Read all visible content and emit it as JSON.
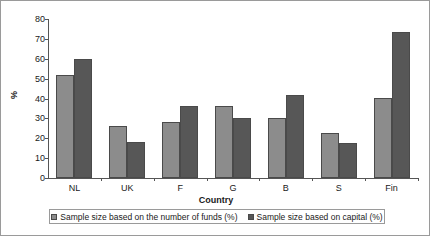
{
  "chart_data": {
    "type": "bar",
    "title": "",
    "subtitle": "",
    "xlabel": "Country",
    "ylabel": "%",
    "ylim": [
      0,
      80
    ],
    "yticks": [
      0,
      10,
      20,
      30,
      40,
      50,
      60,
      70,
      80
    ],
    "ytick_labels": [
      "0",
      "10",
      "20",
      "30",
      "40",
      "50",
      "60",
      "70",
      "80"
    ],
    "grid": false,
    "legend_position": "bottom",
    "categories": [
      "NL",
      "UK",
      "F",
      "G",
      "B",
      "S",
      "Fin"
    ],
    "series": [
      {
        "name": "Sample size based on the number of funds (%)",
        "color": "#8c8c8c",
        "values": [
          52,
          26,
          28,
          36,
          30,
          22.5,
          40.5
        ]
      },
      {
        "name": "Sample size based on capital (%)",
        "color": "#575757",
        "values": [
          60,
          18,
          36,
          30,
          42,
          17.5,
          73.5
        ]
      }
    ]
  }
}
